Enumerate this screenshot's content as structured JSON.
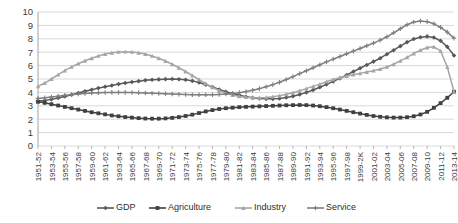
{
  "chart_data": {
    "type": "line",
    "title": "",
    "xlabel": "",
    "ylabel": "",
    "ylim": [
      0,
      10
    ],
    "ytick_step": 1,
    "grid": true,
    "legend_position": "bottom",
    "categories": [
      "1951-52",
      "1952-53",
      "1953-54",
      "1954-55",
      "1955-56",
      "1956-57",
      "1957-58",
      "1958-59",
      "1959-60",
      "1960-61",
      "1961-62",
      "1962-63",
      "1963-64",
      "1964-65",
      "1965-66",
      "1966-67",
      "1967-68",
      "1968-69",
      "1969-70",
      "1970-71",
      "1971-72",
      "1972-73",
      "1973-74",
      "1974-75",
      "1975-76",
      "1976-77",
      "1977-78",
      "1978-79",
      "1979-80",
      "1980-81",
      "1981-82",
      "1982-83",
      "1983-84",
      "1984-85",
      "1985-86",
      "1986-87",
      "1987-88",
      "1988-89",
      "1989-90",
      "1990-91",
      "1991-92",
      "1992-93",
      "1993-94",
      "1994-95",
      "1995-96",
      "1996-97",
      "1997-98",
      "1998-99",
      "1999-2K",
      "2000-01",
      "2001-02",
      "2002-03",
      "2003-04",
      "2004-05",
      "2005-06",
      "2006-07",
      "2007-08",
      "2008-09",
      "2009-10",
      "2010-11",
      "2011-12",
      "2012-13",
      "2013-14"
    ],
    "xtick_labels": [
      "1951-52",
      "1953-54",
      "1955-56",
      "1957-58",
      "1959-60",
      "1961-62",
      "1963-64",
      "1965-66",
      "1967-68",
      "1969-70",
      "1971-72",
      "1973-74",
      "1975-76",
      "1977-78",
      "1979-80",
      "1981-82",
      "1983-84",
      "1985-86",
      "1987-88",
      "1989-90",
      "1991-92",
      "1993-94",
      "1995-96",
      "1997-98",
      "1999-2K",
      "2001-02",
      "2003-04",
      "2005-06",
      "2007-08",
      "2009-10",
      "2011-12",
      "2013-14"
    ],
    "ytick_labels": [
      "0",
      "1",
      "2",
      "3",
      "4",
      "5",
      "6",
      "7",
      "8",
      "9",
      "10"
    ],
    "series": [
      {
        "name": "GDP",
        "color": "#595959",
        "marker": "diamond",
        "values": [
          3.35,
          3.4,
          3.48,
          3.58,
          3.7,
          3.82,
          3.95,
          4.08,
          4.2,
          4.32,
          4.42,
          4.52,
          4.62,
          4.7,
          4.78,
          4.84,
          4.9,
          4.94,
          4.97,
          4.99,
          5.0,
          4.98,
          4.94,
          4.86,
          4.74,
          4.58,
          4.4,
          4.22,
          4.05,
          3.9,
          3.78,
          3.68,
          3.6,
          3.55,
          3.52,
          3.52,
          3.55,
          3.62,
          3.72,
          3.85,
          4.0,
          4.18,
          4.38,
          4.6,
          4.82,
          5.05,
          5.3,
          5.55,
          5.8,
          6.05,
          6.3,
          6.55,
          6.85,
          7.15,
          7.45,
          7.75,
          7.98,
          8.12,
          8.18,
          8.1,
          7.85,
          7.4,
          6.75
        ]
      },
      {
        "name": "Agriculture",
        "color": "#404040",
        "marker": "square",
        "values": [
          3.3,
          3.22,
          3.12,
          3.02,
          2.92,
          2.82,
          2.72,
          2.62,
          2.52,
          2.44,
          2.36,
          2.28,
          2.22,
          2.16,
          2.12,
          2.08,
          2.05,
          2.04,
          2.04,
          2.06,
          2.1,
          2.16,
          2.24,
          2.34,
          2.46,
          2.58,
          2.68,
          2.76,
          2.82,
          2.86,
          2.9,
          2.92,
          2.94,
          2.96,
          2.98,
          3.0,
          3.02,
          3.04,
          3.05,
          3.06,
          3.05,
          3.02,
          2.97,
          2.9,
          2.82,
          2.72,
          2.62,
          2.52,
          2.42,
          2.32,
          2.24,
          2.18,
          2.14,
          2.12,
          2.12,
          2.15,
          2.22,
          2.35,
          2.55,
          2.85,
          3.2,
          3.6,
          4.05
        ]
      },
      {
        "name": "Industry",
        "color": "#a6a6a6",
        "marker": "triangle",
        "values": [
          4.45,
          4.7,
          5.0,
          5.32,
          5.62,
          5.9,
          6.14,
          6.36,
          6.55,
          6.72,
          6.86,
          6.96,
          7.02,
          7.04,
          7.02,
          6.96,
          6.86,
          6.72,
          6.55,
          6.34,
          6.1,
          5.84,
          5.56,
          5.26,
          4.96,
          4.66,
          4.38,
          4.14,
          3.94,
          3.8,
          3.7,
          3.64,
          3.6,
          3.6,
          3.62,
          3.68,
          3.76,
          3.86,
          3.98,
          4.12,
          4.28,
          4.45,
          4.62,
          4.8,
          4.96,
          5.1,
          5.22,
          5.32,
          5.42,
          5.52,
          5.62,
          5.74,
          5.9,
          6.1,
          6.35,
          6.62,
          6.9,
          7.15,
          7.35,
          7.4,
          7.1,
          5.9,
          4.05
        ]
      },
      {
        "name": "Service",
        "color": "#7f7f7f",
        "marker": "cross",
        "values": [
          3.55,
          3.6,
          3.66,
          3.72,
          3.78,
          3.83,
          3.88,
          3.92,
          3.95,
          3.97,
          3.99,
          4.0,
          4.0,
          4.0,
          3.99,
          3.98,
          3.96,
          3.94,
          3.92,
          3.9,
          3.88,
          3.86,
          3.84,
          3.83,
          3.82,
          3.82,
          3.83,
          3.85,
          3.88,
          3.92,
          3.98,
          4.06,
          4.16,
          4.28,
          4.42,
          4.58,
          4.76,
          4.96,
          5.18,
          5.4,
          5.62,
          5.84,
          6.06,
          6.28,
          6.48,
          6.68,
          6.88,
          7.08,
          7.28,
          7.48,
          7.68,
          7.9,
          8.15,
          8.45,
          8.75,
          9.05,
          9.25,
          9.32,
          9.28,
          9.12,
          8.85,
          8.5,
          8.05
        ]
      }
    ]
  },
  "legend": {
    "items": [
      {
        "label": "GDP"
      },
      {
        "label": "Agriculture"
      },
      {
        "label": "Industry"
      },
      {
        "label": "Service"
      }
    ]
  }
}
